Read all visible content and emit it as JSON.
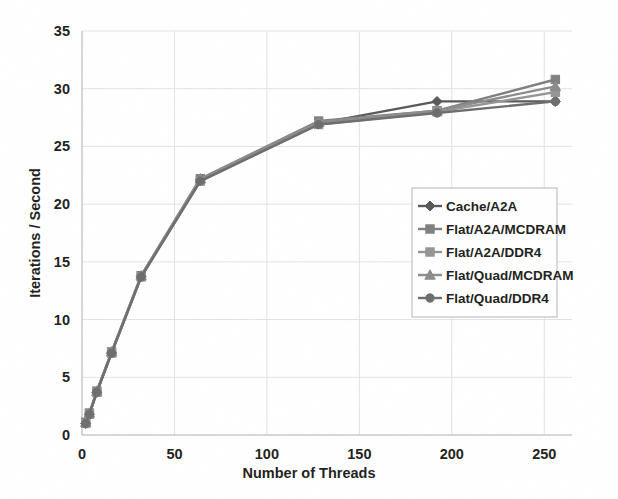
{
  "chart_data": {
    "type": "line",
    "title": "",
    "xlabel": "Number of Threads",
    "ylabel": "Iterations / Second",
    "xlim": [
      0,
      265
    ],
    "ylim": [
      0,
      35
    ],
    "xticks": [
      0,
      50,
      100,
      150,
      200,
      250
    ],
    "yticks": [
      0,
      5,
      10,
      15,
      20,
      25,
      30,
      35
    ],
    "grid": true,
    "legend_position": "center-right",
    "x": [
      2,
      4,
      8,
      16,
      32,
      64,
      128,
      192,
      256
    ],
    "series": [
      {
        "name": "Cache/A2A",
        "marker": "diamond",
        "color": "#595959",
        "values": [
          1.0,
          1.8,
          3.7,
          7.1,
          13.7,
          22.1,
          27.0,
          28.9,
          28.9
        ]
      },
      {
        "name": "Flat/A2A/MCDRAM",
        "marker": "square",
        "color": "#808080",
        "values": [
          1.1,
          1.9,
          3.8,
          7.2,
          13.8,
          22.2,
          27.2,
          28.1,
          30.8
        ]
      },
      {
        "name": "Flat/A2A/DDR4",
        "marker": "square",
        "color": "#969696",
        "values": [
          1.0,
          1.8,
          3.7,
          7.1,
          13.7,
          22.0,
          26.9,
          28.0,
          29.7
        ]
      },
      {
        "name": "Flat/Quad/MCDRAM",
        "marker": "triangle",
        "color": "#8c8c8c",
        "values": [
          1.1,
          1.9,
          3.8,
          7.2,
          13.8,
          22.2,
          27.1,
          28.1,
          30.2
        ]
      },
      {
        "name": "Flat/Quad/DDR4",
        "marker": "circle",
        "color": "#6e6e6e",
        "values": [
          1.0,
          1.8,
          3.7,
          7.1,
          13.7,
          22.0,
          26.9,
          27.9,
          28.9
        ]
      }
    ]
  },
  "axes": {
    "y_label": "Iterations / Second",
    "x_label": "Number of Threads",
    "y_tick_labels": [
      "0",
      "5",
      "10",
      "15",
      "20",
      "25",
      "30",
      "35"
    ],
    "x_tick_labels": [
      "0",
      "50",
      "100",
      "150",
      "200",
      "250"
    ]
  },
  "legend": {
    "entries": [
      {
        "label": "Cache/A2A"
      },
      {
        "label": "Flat/A2A/MCDRAM"
      },
      {
        "label": "Flat/A2A/DDR4"
      },
      {
        "label": "Flat/Quad/MCDRAM"
      },
      {
        "label": "Flat/Quad/DDR4"
      }
    ]
  },
  "colors": {
    "gridline": "#e2e2e2",
    "axis": "#bdbdbd",
    "text": "#231f20",
    "legend_border": "#b5b5b5",
    "background": "#ffffff"
  }
}
